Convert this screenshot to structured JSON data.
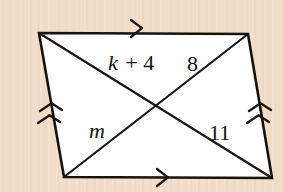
{
  "figure": {
    "background_color": "#f3ddc9",
    "shape_fill": "#ffffff",
    "stroke_color": "#16120f",
    "labels": {
      "diagonal_upper_left": "k + 4",
      "diagonal_upper_left_variable": "k",
      "diagonal_upper_left_operator": " + 4",
      "diagonal_upper_right": "8",
      "diagonal_lower_left": "m",
      "diagonal_lower_right": "11"
    },
    "tick_marks": {
      "top_side": "single-arrow",
      "bottom_side": "single-arrow",
      "left_side": "double-arrow",
      "right_side": "double-arrow"
    },
    "vertices": {
      "top_left": [
        39,
        33
      ],
      "top_right": [
        248,
        34
      ],
      "bottom_right": [
        272,
        178
      ],
      "bottom_left": [
        64,
        177
      ],
      "intersection": [
        156,
        106
      ]
    }
  }
}
